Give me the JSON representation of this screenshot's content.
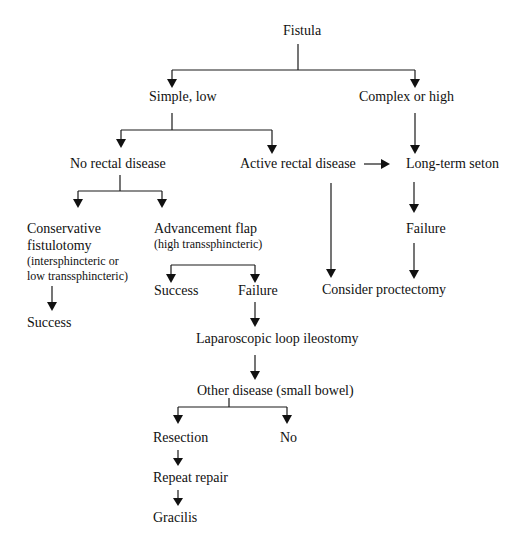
{
  "diagram": {
    "type": "flowchart",
    "colors": {
      "line": "#1a1a1a",
      "text": "#111111",
      "background": "#ffffff"
    },
    "nodes": {
      "fistula": {
        "label": "Fistula"
      },
      "simple_low": {
        "label": "Simple, low"
      },
      "complex_high": {
        "label": "Complex or high"
      },
      "no_rectal": {
        "label": "No rectal disease"
      },
      "active_rectal": {
        "label": "Active rectal disease"
      },
      "long_term_seton": {
        "label": "Long-term seton"
      },
      "conservative": {
        "label_line1": "Conservative",
        "label_line2": "fistulotomy",
        "sub_line1": "(intersphincteric or",
        "sub_line2": "low transsphincteric)"
      },
      "advancement_flap": {
        "label": "Advancement flap",
        "sub": "(high transsphincteric)"
      },
      "seton_failure": {
        "label": "Failure"
      },
      "consider_proctectomy": {
        "label": "Consider proctectomy"
      },
      "conservative_success": {
        "label": "Success"
      },
      "flap_success": {
        "label": "Success"
      },
      "flap_failure": {
        "label": "Failure"
      },
      "lap_ileostomy": {
        "label": "Laparoscopic loop ileostomy"
      },
      "other_disease": {
        "label": "Other disease (small bowel)"
      },
      "resection": {
        "label": "Resection"
      },
      "no": {
        "label": "No"
      },
      "repeat_repair": {
        "label": "Repeat repair"
      },
      "gracilis": {
        "label": "Gracilis"
      }
    },
    "edges": [
      {
        "from": "fistula",
        "to": "simple_low"
      },
      {
        "from": "fistula",
        "to": "complex_high"
      },
      {
        "from": "simple_low",
        "to": "no_rectal"
      },
      {
        "from": "simple_low",
        "to": "active_rectal"
      },
      {
        "from": "complex_high",
        "to": "long_term_seton"
      },
      {
        "from": "active_rectal",
        "to": "long_term_seton"
      },
      {
        "from": "active_rectal",
        "to": "consider_proctectomy"
      },
      {
        "from": "no_rectal",
        "to": "conservative"
      },
      {
        "from": "no_rectal",
        "to": "advancement_flap"
      },
      {
        "from": "long_term_seton",
        "to": "seton_failure"
      },
      {
        "from": "seton_failure",
        "to": "consider_proctectomy"
      },
      {
        "from": "conservative",
        "to": "conservative_success"
      },
      {
        "from": "advancement_flap",
        "to": "flap_success"
      },
      {
        "from": "advancement_flap",
        "to": "flap_failure"
      },
      {
        "from": "flap_failure",
        "to": "lap_ileostomy"
      },
      {
        "from": "lap_ileostomy",
        "to": "other_disease"
      },
      {
        "from": "other_disease",
        "to": "resection"
      },
      {
        "from": "other_disease",
        "to": "no"
      },
      {
        "from": "resection",
        "to": "repeat_repair"
      },
      {
        "from": "repeat_repair",
        "to": "gracilis"
      }
    ]
  },
  "caption": {
    "text": ""
  }
}
